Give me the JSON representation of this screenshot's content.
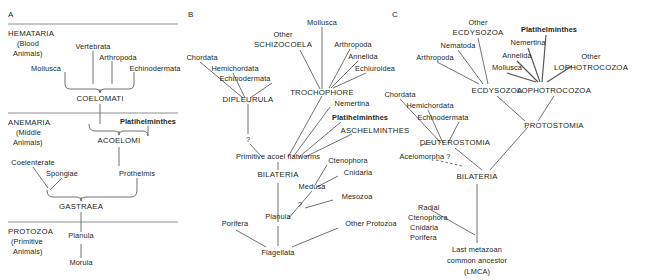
{
  "figure": {
    "background_color": "#ffffff",
    "line_color": "#58585b",
    "rule_color": "#808285",
    "text_color": "#231f20"
  },
  "panels": [
    {
      "id": "A",
      "letter": "A",
      "grades": [
        {
          "name": "HEMATARIA",
          "gloss_line1": "(Blood",
          "gloss_line2": "Animals)"
        },
        {
          "name": "ANEMARIA",
          "gloss_line1": "(Middle",
          "gloss_line2": "Animals)"
        },
        {
          "name": "PROTOZOA",
          "gloss_line1": "(Primitive",
          "gloss_line2": "Animals)"
        }
      ],
      "taxa": [
        {
          "label": "Vertebrata",
          "bold": false,
          "caps": false
        },
        {
          "label": "Arthropoda",
          "bold": false,
          "caps": false
        },
        {
          "label": "Mollusca",
          "bold": false,
          "caps": false
        },
        {
          "label": "Echinodermata",
          "bold": false,
          "caps": false
        },
        {
          "label": "COELOMATI",
          "bold": false,
          "caps": true
        },
        {
          "label": "Platihelminthes",
          "bold": true,
          "caps": false
        },
        {
          "label": "ACOELOMI",
          "bold": false,
          "caps": true
        },
        {
          "label": "Coelenterate",
          "bold": false,
          "caps": false
        },
        {
          "label": "Spongiae",
          "bold": false,
          "caps": false
        },
        {
          "label": "Prothelmis",
          "bold": false,
          "caps": false
        },
        {
          "label": "GASTRAEA",
          "bold": false,
          "caps": true
        },
        {
          "label": "Planula",
          "bold": false,
          "caps": false
        },
        {
          "label": "Morula",
          "bold": false,
          "caps": false
        }
      ]
    },
    {
      "id": "B",
      "letter": "B",
      "taxa": [
        {
          "label": "Mollusca",
          "bold": false,
          "caps": false
        },
        {
          "label": "Other",
          "bold": false,
          "caps": false
        },
        {
          "label": "SCHIZOCOELA",
          "bold": false,
          "caps": true
        },
        {
          "label": "Arthropoda",
          "bold": false,
          "caps": false
        },
        {
          "label": "Annelida",
          "bold": false,
          "caps": false
        },
        {
          "label": "Echiuroidea",
          "bold": false,
          "caps": false
        },
        {
          "label": "Chordata",
          "bold": false,
          "caps": false
        },
        {
          "label": "Hemichordata",
          "bold": false,
          "caps": false
        },
        {
          "label": "Echinodermata",
          "bold": false,
          "caps": false
        },
        {
          "label": "TROCHOPHORE",
          "bold": false,
          "caps": true
        },
        {
          "label": "DIPLEURULA",
          "bold": false,
          "caps": true
        },
        {
          "label": "Nemertina",
          "bold": false,
          "caps": false
        },
        {
          "label": "Platihelminthes",
          "bold": true,
          "caps": false
        },
        {
          "label": "ASCHELMINTHES",
          "bold": false,
          "caps": true
        },
        {
          "label": "?",
          "bold": false,
          "caps": false
        },
        {
          "label": "Primitive acoel flatworms",
          "bold": false,
          "caps": false
        },
        {
          "label": "BILATERIA",
          "bold": false,
          "caps": true
        },
        {
          "label": "Ctenophora",
          "bold": false,
          "caps": false
        },
        {
          "label": "Cnidaria",
          "bold": false,
          "caps": false
        },
        {
          "label": "Medusa",
          "bold": false,
          "caps": false
        },
        {
          "label": "Mesozoa",
          "bold": false,
          "caps": false
        },
        {
          "label": "Planula",
          "bold": false,
          "caps": false
        },
        {
          "label": "Porifera",
          "bold": false,
          "caps": false
        },
        {
          "label": "Other Protozoa",
          "bold": false,
          "caps": false
        },
        {
          "label": "Flagellata",
          "bold": false,
          "caps": false
        }
      ]
    },
    {
      "id": "C",
      "letter": "C",
      "taxa": [
        {
          "label": "Other",
          "bold": false,
          "caps": false
        },
        {
          "label": "ECDYSOZOA",
          "bold": false,
          "caps": true
        },
        {
          "label": "Platihelminthes",
          "bold": true,
          "caps": false
        },
        {
          "label": "Nematoda",
          "bold": false,
          "caps": false
        },
        {
          "label": "Nemertina",
          "bold": false,
          "caps": false
        },
        {
          "label": "Arthropoda",
          "bold": false,
          "caps": false
        },
        {
          "label": "Annelida",
          "bold": false,
          "caps": false
        },
        {
          "label": "Other",
          "bold": false,
          "caps": false
        },
        {
          "label": "Mollusca",
          "bold": false,
          "caps": false
        },
        {
          "label": "LOPHOTROCOZOA",
          "bold": false,
          "caps": true
        },
        {
          "label": "ECDYSOZOA",
          "bold": false,
          "caps": true
        },
        {
          "label": "LOPHOTROCOZOA",
          "bold": false,
          "caps": true
        },
        {
          "label": "Chordata",
          "bold": false,
          "caps": false
        },
        {
          "label": "Hemichordata",
          "bold": false,
          "caps": false
        },
        {
          "label": "Echinodermata",
          "bold": false,
          "caps": false
        },
        {
          "label": "PROTOSTOMIA",
          "bold": false,
          "caps": true
        },
        {
          "label": "DEUTEROSTOMIA",
          "bold": false,
          "caps": true
        },
        {
          "label": "Acelomorpha ?",
          "bold": false,
          "caps": false
        },
        {
          "label": "BILATERIA",
          "bold": false,
          "caps": true
        },
        {
          "label": "Radial",
          "bold": false,
          "caps": false
        },
        {
          "label": "Ctenophora",
          "bold": false,
          "caps": false
        },
        {
          "label": "Cnidaria",
          "bold": false,
          "caps": false
        },
        {
          "label": "Porifera",
          "bold": false,
          "caps": false
        },
        {
          "label": "Last metazoan",
          "bold": false,
          "caps": false
        },
        {
          "label": "common ancestor",
          "bold": false,
          "caps": false
        },
        {
          "label": "(LMCA)",
          "bold": false,
          "caps": false
        }
      ]
    }
  ],
  "labels": {
    "a_letter": "A",
    "a_hemataria": "HEMATARIA",
    "a_blood": "(Blood",
    "a_animals1": "Animals)",
    "a_vertebrata": "Vertebrata",
    "a_arthropoda": "Arthropoda",
    "a_mollusca": "Mollusca",
    "a_echinodermata": "Echinodermata",
    "a_coelomati": "COELOMATI",
    "a_anemaria": "ANEMARIA",
    "a_middle": "(Middle",
    "a_animals2": "Animals)",
    "a_platihelminthes": "Platihelminthes",
    "a_acoelomi": "ACOELOMI",
    "a_coelenterate": "Coelenterate",
    "a_spongiae": "Spongiae",
    "a_prothelmis": "Prothelmis",
    "a_gastraea": "GASTRAEA",
    "a_protozoa": "PROTOZOA",
    "a_primitive": "(Primitive",
    "a_animals3": "Animals)",
    "a_planula": "Planula",
    "a_morula": "Morula",
    "b_letter": "B",
    "b_mollusca": "Mollusca",
    "b_other": "Other",
    "b_schizocoela": "SCHIZOCOELA",
    "b_arthropoda": "Arthropoda",
    "b_annelida": "Annelida",
    "b_echiuroidea": "Echiuroidea",
    "b_chordata": "Chordata",
    "b_hemichordata": "Hemichordata",
    "b_echinodermata": "Echinodermata",
    "b_trochophore": "TROCHOPHORE",
    "b_dipleurula": "DIPLEURULA",
    "b_nemertina": "Nemertina",
    "b_platihelminthes": "Platihelminthes",
    "b_aschelminthes": "ASCHELMINTHES",
    "b_question1": "?",
    "b_primitive_acoel": "Primitive acoel flatworms",
    "b_bilateria": "BILATERIA",
    "b_ctenophora": "Ctenophora",
    "b_cnidaria": "Cnidaria",
    "b_medusa": "Medusa",
    "b_mesozoa": "Mesozoa",
    "b_question2": "?",
    "b_planula": "Planula",
    "b_porifera": "Porifera",
    "b_other_protozoa": "Other Protozoa",
    "b_flagellata": "Flagellata",
    "c_letter": "C",
    "c_other1": "Other",
    "c_ecdysozoa_top": "ECDYSOZOA",
    "c_platihelminthes": "Platihelminthes",
    "c_nematoda": "Nematoda",
    "c_nemertina": "Nemertina",
    "c_arthropoda": "Arthropoda",
    "c_annelida": "Annelida",
    "c_other2": "Other",
    "c_mollusca": "Mollusca",
    "c_lophotrocozoa_top": "LOPHOTROCOZOA",
    "c_ecdysozoa_node": "ECDYSOZOA",
    "c_lophotrocozoa_node": "LOPHOTROCOZOA",
    "c_chordata": "Chordata",
    "c_hemichordata": "Hemichordata",
    "c_echinodermata": "Echinodermata",
    "c_protostomia": "PROTOSTOMIA",
    "c_deuterostomia": "DEUTEROSTOMIA",
    "c_acelomorpha": "Acelomorpha ?",
    "c_bilateria": "BILATERIA",
    "c_radial": "Radial",
    "c_ctenophora": "Ctenophora",
    "c_cnidaria": "Cnidaria",
    "c_porifera": "Porifera",
    "c_lmca_line1": "Last metazoan",
    "c_lmca_line2": "common ancestor",
    "c_lmca_line3": "(LMCA)"
  }
}
